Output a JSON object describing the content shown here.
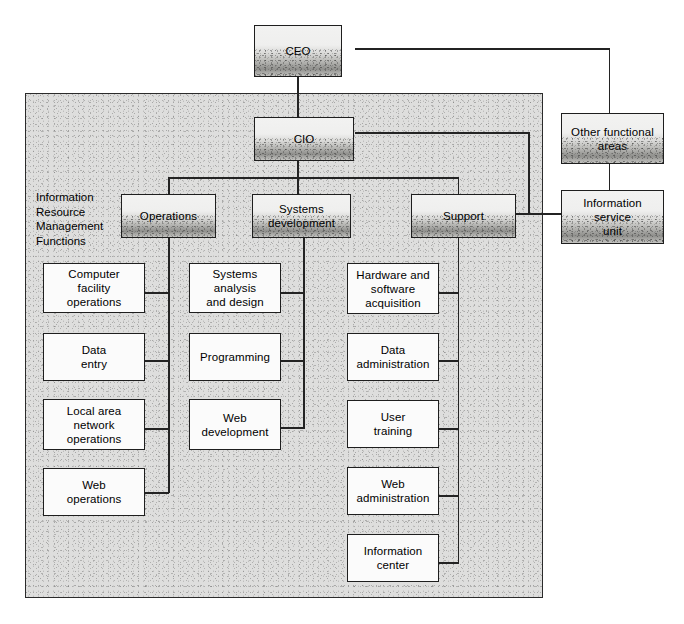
{
  "diagram": {
    "caption": "Information\nResource\nManagement\nFunctions",
    "frame_label": "irm-department-frame",
    "colors": {
      "line": "#232323",
      "box_border": "#1e1e1e",
      "leaf_fill": "#fbfbfb",
      "frame_fill": "#dededd",
      "shaded_fill": "#c9c9c6"
    },
    "executives": [
      {
        "id": "ceo",
        "label": "CEO"
      },
      {
        "id": "cio",
        "label": "CIO"
      }
    ],
    "divisions": [
      {
        "id": "operations",
        "label": "Operations"
      },
      {
        "id": "systems-development",
        "label": "Systems\ndevelopment"
      },
      {
        "id": "support",
        "label": "Support"
      }
    ],
    "external": [
      {
        "id": "other-functional-areas",
        "label": "Other functional\nareas"
      },
      {
        "id": "information-service-unit",
        "label": "Information\nservice\nunit"
      }
    ],
    "columns": [
      {
        "parent": "operations",
        "items": [
          {
            "id": "computer-facility-operations",
            "label": "Computer\nfacility\noperations"
          },
          {
            "id": "data-entry",
            "label": "Data\nentry"
          },
          {
            "id": "local-area-network-operations",
            "label": "Local area\nnetwork\noperations"
          },
          {
            "id": "web-operations",
            "label": "Web\noperations"
          }
        ]
      },
      {
        "parent": "systems-development",
        "items": [
          {
            "id": "systems-analysis-and-design",
            "label": "Systems\nanalysis\nand design"
          },
          {
            "id": "programming",
            "label": "Programming"
          },
          {
            "id": "web-development",
            "label": "Web\ndevelopment"
          }
        ]
      },
      {
        "parent": "support",
        "items": [
          {
            "id": "hardware-and-software-acquisition",
            "label": "Hardware and\nsoftware\nacquisition"
          },
          {
            "id": "data-administration",
            "label": "Data\nadministration"
          },
          {
            "id": "user-training",
            "label": "User\ntraining"
          },
          {
            "id": "web-administration",
            "label": "Web\nadministration"
          },
          {
            "id": "information-center",
            "label": "Information\ncenter"
          }
        ]
      }
    ]
  }
}
